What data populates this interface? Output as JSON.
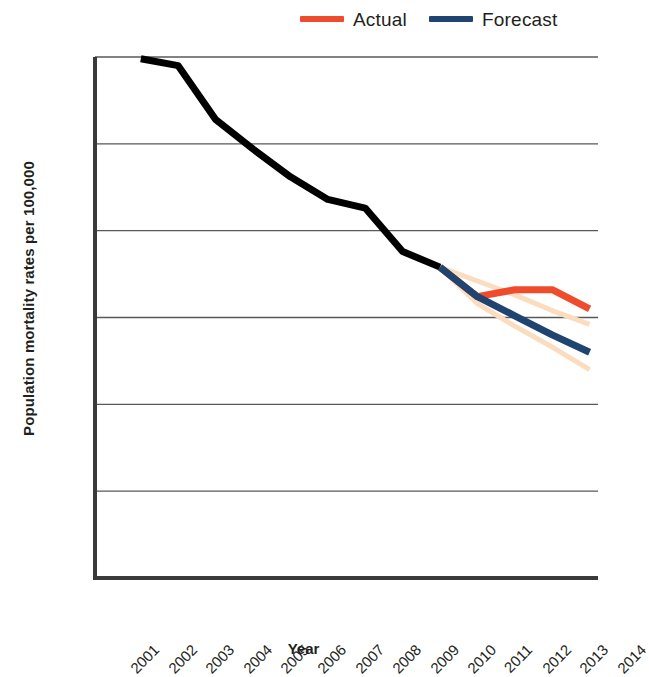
{
  "legend": {
    "items": [
      {
        "label": "Actual",
        "color": "#EF4B2D"
      },
      {
        "label": "Forecast",
        "color": "#1F4470"
      }
    ]
  },
  "axes": {
    "y_title": "Population mortality rates per 100,000",
    "x_title": "Year"
  },
  "chart_data": {
    "type": "line",
    "title": "",
    "xlabel": "Year",
    "ylabel": "Population mortality rates per 100,000",
    "x": [
      "2001",
      "2002",
      "2003",
      "2004",
      "2005",
      "2006",
      "2007",
      "2008",
      "2009",
      "2010",
      "2011",
      "2012",
      "2013",
      "2014"
    ],
    "ylim": [
      350,
      650
    ],
    "yticks": [
      350,
      400,
      450,
      500,
      550,
      600,
      650
    ],
    "grid": "horizontal",
    "legend_position": "top-right",
    "series": [
      {
        "name": "Historical",
        "color": "#000000",
        "values": [
          null,
          649,
          645,
          614,
          597,
          581,
          568,
          563,
          538,
          529,
          null,
          null,
          null,
          null
        ]
      },
      {
        "name": "Actual",
        "color": "#EF4B2D",
        "values": [
          null,
          null,
          null,
          null,
          null,
          null,
          null,
          null,
          null,
          529,
          512,
          516,
          516,
          505
        ]
      },
      {
        "name": "Forecast",
        "color": "#1F4470",
        "values": [
          null,
          null,
          null,
          null,
          null,
          null,
          null,
          null,
          null,
          529,
          512,
          501,
          490,
          480
        ]
      },
      {
        "name": "Forecast upper bound",
        "color": "#FBDCBE",
        "values": [
          null,
          null,
          null,
          null,
          null,
          null,
          null,
          null,
          null,
          529,
          521,
          513,
          504,
          496
        ]
      },
      {
        "name": "Forecast lower bound",
        "color": "#FBDCBE",
        "values": [
          null,
          null,
          null,
          null,
          null,
          null,
          null,
          null,
          null,
          529,
          508,
          495,
          483,
          470
        ]
      }
    ]
  }
}
